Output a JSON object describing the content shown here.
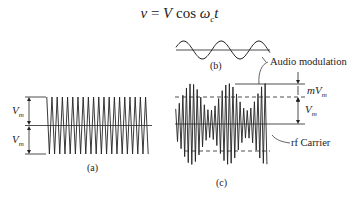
{
  "equation": "v = V cos ω_c t",
  "equation_parts": {
    "lhs": "v",
    "eq": " = ",
    "amp": "V",
    "func": " cos ",
    "omega": "ω",
    "sub": "c",
    "t": "t"
  },
  "panel_a": {
    "caption": "(a)",
    "upper_label": "V",
    "upper_label_sub": "m",
    "lower_label": "V",
    "lower_label_sub": "m",
    "carrier_cycles": 20
  },
  "panel_b": {
    "caption": "(b)",
    "cycles": 2.5
  },
  "panel_c": {
    "caption": "(c)",
    "mod_label": "mV",
    "mod_label_sub": "m",
    "vm_label": "V",
    "vm_label_sub": "m",
    "audio_annotation": "Audio modulation",
    "carrier_annotation": "rf Carrier"
  },
  "colors": {
    "ink": "#222222",
    "background": "#ffffff"
  }
}
